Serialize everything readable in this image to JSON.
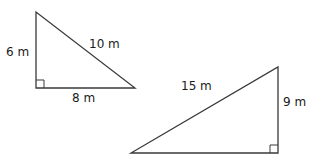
{
  "diagram": {
    "triangle_small": {
      "vertical_leg_label": "6 m",
      "horizontal_leg_label": "8 m",
      "hypotenuse_label": "10 m",
      "vertices": {
        "top": [
          36,
          12
        ],
        "right_angle": [
          36,
          88
        ],
        "right": [
          135,
          88
        ]
      }
    },
    "triangle_large": {
      "vertical_leg_label": "9 m",
      "hypotenuse_label": "15 m",
      "vertices": {
        "top": [
          278,
          67
        ],
        "right_angle": [
          278,
          153
        ],
        "left": [
          131,
          153
        ]
      }
    },
    "colors": {
      "stroke": "#3a3a3a",
      "text": "#1a1a1a",
      "background": "#ffffff"
    }
  }
}
